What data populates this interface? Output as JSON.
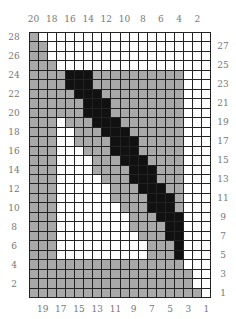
{
  "chart_data": {
    "type": "heatmap",
    "title": "",
    "columns": 20,
    "rows": 28,
    "legend": {
      "W": "white / empty",
      "G": "gray / filled",
      "B": "black / filled"
    },
    "colors": {
      "W": "#ffffff",
      "G": "#a9a9a9",
      "B": "#111111",
      "grid": "#222222",
      "label": "#777777"
    },
    "top_labels": [
      "20",
      "18",
      "16",
      "14",
      "12",
      "10",
      "8",
      "6",
      "4",
      "2"
    ],
    "bottom_labels": [
      "19",
      "17",
      "15",
      "13",
      "11",
      "9",
      "7",
      "5",
      "3",
      "1"
    ],
    "left_labels": [
      "28",
      "26",
      "24",
      "22",
      "20",
      "18",
      "16",
      "14",
      "12",
      "10",
      "8",
      "6",
      "4",
      "2"
    ],
    "right_labels": [
      "27",
      "25",
      "23",
      "21",
      "19",
      "17",
      "15",
      "13",
      "11",
      "9",
      "7",
      "5",
      "3",
      "1"
    ],
    "row_order": "top row = 28, bottom row = 1; leftmost column = 20, rightmost column = 1",
    "grid_rows": [
      "GWWWWWWWWWWWWWWWWWWW",
      "GGWWWWWWWWWWWWWWWWWW",
      "GGWWWWWWWWWWWWWWWWWW",
      "GGGWWWWWWWWWWWWWWWWW",
      "GGGGBBBGGGGGGGGGGWWW",
      "GGGGBBBGGGGGGGGGGWWW",
      "GGGGGBBBGGGGGGGGGWWW",
      "GGGGGGBBBGGGGGGGGWWW",
      "GGGGGGBBBGGGGGGGGWWW",
      "GGGWGGGBBBGGGGGGGWWW",
      "GGGWWGGGBBBGGGGGGWWW",
      "GGGWWGGGGBBBGGGGGWWW",
      "GGGWWWGGGBBBGGGGGWWW",
      "GGGWWWWGGGBBBGGGGWWW",
      "GGGWWWWGGGGBBBGGGWWW",
      "GGGWWWWWGGGBBBGGGWWW",
      "GGGWWWWWWGGGBBBGGWWW",
      "GGGWWWWWWGGGGBBBGWWW",
      "GGGWWWWWWWGGGBBBGWWW",
      "GGGWWWWWWWWGGGBBBWWW",
      "GGGWWWWWWWWGGGGBBWWW",
      "GGGWWWWWWWWWGGGBBWWW",
      "GGGWWWWWWWWWWGGGBWWW",
      "GGGWWWWWWWWWWGGGBWWW",
      "GGGGGGGGGGGGGGGGGWWW",
      "GGGGGGGGGGGGGGGGGGWW",
      "GGGGGGGGGGGGGGGGGGWW",
      "GGGGGGGGGGGGGGGGGGGW"
    ]
  }
}
